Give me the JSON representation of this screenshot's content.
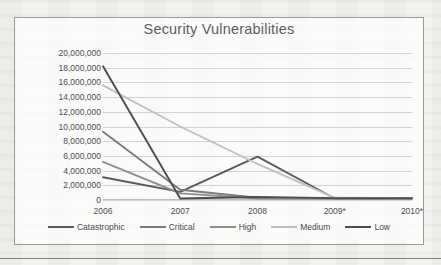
{
  "chart_data": {
    "type": "line",
    "title": "Security Vulnerabilities",
    "xlabel": "",
    "ylabel": "",
    "categories": [
      "2006",
      "2007",
      "2008",
      "2009*",
      "2010*"
    ],
    "ylim": [
      0,
      20000000
    ],
    "ytick_step": 2000000,
    "yticks": [
      "20,000,000",
      "18,000,000",
      "16,000,000",
      "14,000,000",
      "12,000,000",
      "10,000,000",
      "8,000,000",
      "6,000,000",
      "4,000,000",
      "2,000,000",
      "0"
    ],
    "grid": true,
    "legend_position": "bottom",
    "series": [
      {
        "name": "Catastrophic",
        "color": "#5a5a5a",
        "values": [
          3100000,
          1100000,
          5900000,
          200000,
          200000
        ]
      },
      {
        "name": "Critical",
        "color": "#7b7b7b",
        "values": [
          9300000,
          1400000,
          300000,
          200000,
          200000
        ]
      },
      {
        "name": "High",
        "color": "#8e8e8e",
        "values": [
          5200000,
          900000,
          200000,
          200000,
          200000
        ]
      },
      {
        "name": "Medium",
        "color": "#c0c0c0",
        "values": [
          15600000,
          10000000,
          4900000,
          300000,
          250000
        ]
      },
      {
        "name": "Low",
        "color": "#4d4d4d",
        "values": [
          18200000,
          200000,
          400000,
          250000,
          250000
        ]
      }
    ]
  }
}
